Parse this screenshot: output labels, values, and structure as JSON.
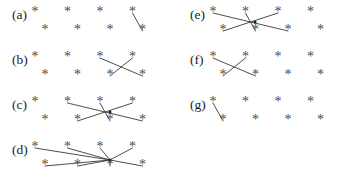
{
  "figure": {
    "title": "",
    "point_glyph": "*",
    "line_color": "#3a3a3a",
    "point_color": "#4a4a4a",
    "label_color": "#1a1a1a",
    "background_color": "#ffffff",
    "grid": {
      "columns": 4,
      "rows": 2,
      "column_spacing": 32.5,
      "row_spacing": 18,
      "bottom_row_offset": 10
    },
    "panels": [
      {
        "id": "a",
        "label": "(a)",
        "label_x": 12,
        "label_y": 19,
        "origin_x": 35,
        "origin_y": 13,
        "point_count": 8,
        "line_count": 1,
        "line_description": "one vertical segment at column 4",
        "lines": [
          {
            "name": "vertical-col4",
            "x1": 132.5,
            "y1": 13,
            "x2": 142.5,
            "y2": 31
          }
        ]
      },
      {
        "id": "b",
        "label": "(b)",
        "label_x": 12,
        "label_y": 64,
        "origin_x": 35,
        "origin_y": 58,
        "point_count": 8,
        "line_count": 2,
        "line_description": "one X crossing between columns 3 and 4",
        "lines": [
          {
            "name": "diag-down-c3-c4",
            "x1": 100,
            "y1": 58,
            "x2": 142.5,
            "y2": 76
          },
          {
            "name": "diag-up-c4-c3",
            "x1": 132.5,
            "y1": 58,
            "x2": 110,
            "y2": 76
          }
        ]
      },
      {
        "id": "c",
        "label": "(c)",
        "label_x": 12,
        "label_y": 109,
        "origin_x": 35,
        "origin_y": 103,
        "point_count": 8,
        "line_count": 3,
        "line_description": "three lines crossing at a common point over columns 2 to 4",
        "hub": {
          "x": 110,
          "y": 112
        },
        "lines": [
          {
            "name": "diag-c2-to-c4",
            "x1": 67.5,
            "y1": 103,
            "x2": 142.5,
            "y2": 121
          },
          {
            "name": "diag-c4-to-c2",
            "x1": 132.5,
            "y1": 103,
            "x2": 77.5,
            "y2": 121
          },
          {
            "name": "vertical-c3",
            "x1": 100,
            "y1": 103,
            "x2": 110,
            "y2": 121
          }
        ]
      },
      {
        "id": "d",
        "label": "(d)",
        "label_x": 12,
        "label_y": 154,
        "origin_x": 35,
        "origin_y": 148,
        "point_count": 8,
        "line_count": 4,
        "line_description": "four lines converging at a single hub node; every point connected",
        "hub": {
          "x": 110,
          "y": 160
        },
        "lines": [
          {
            "name": "ray-c1-top",
            "x1": 35,
            "y1": 148,
            "x2": 110,
            "y2": 160
          },
          {
            "name": "ray-c2-top",
            "x1": 67.5,
            "y1": 148,
            "x2": 110,
            "y2": 160
          },
          {
            "name": "ray-c3-top",
            "x1": 100,
            "y1": 148,
            "x2": 110,
            "y2": 160
          },
          {
            "name": "ray-c4-top",
            "x1": 132.5,
            "y1": 148,
            "x2": 110,
            "y2": 160
          },
          {
            "name": "ray-c1-bottom",
            "x1": 45,
            "y1": 166,
            "x2": 110,
            "y2": 160
          },
          {
            "name": "ray-c2-bottom",
            "x1": 77.5,
            "y1": 166,
            "x2": 110,
            "y2": 160
          },
          {
            "name": "ray-c3-bottom",
            "x1": 110,
            "y1": 166,
            "x2": 110,
            "y2": 160
          },
          {
            "name": "ray-c4-bottom",
            "x1": 142.5,
            "y1": 166,
            "x2": 110,
            "y2": 160
          }
        ]
      },
      {
        "id": "e",
        "label": "(e)",
        "label_x": 190,
        "label_y": 19,
        "origin_x": 213,
        "origin_y": 13,
        "point_count": 8,
        "line_count": 3,
        "line_description": "three lines crossing at a common point over columns 1 to 3",
        "hub": {
          "x": 255,
          "y": 22
        },
        "lines": [
          {
            "name": "diag-c1-to-c3",
            "x1": 213,
            "y1": 13,
            "x2": 288,
            "y2": 31
          },
          {
            "name": "diag-c3-to-c1",
            "x1": 278,
            "y1": 13,
            "x2": 223,
            "y2": 31
          },
          {
            "name": "vertical-c2",
            "x1": 245.5,
            "y1": 13,
            "x2": 255.5,
            "y2": 31
          }
        ]
      },
      {
        "id": "f",
        "label": "(f)",
        "label_x": 190,
        "label_y": 64,
        "origin_x": 213,
        "origin_y": 58,
        "point_count": 8,
        "line_count": 2,
        "line_description": "one X crossing between columns 1 and 2",
        "lines": [
          {
            "name": "diag-down-c1-c2",
            "x1": 213,
            "y1": 58,
            "x2": 255.5,
            "y2": 76
          },
          {
            "name": "diag-up-c2-c1",
            "x1": 245.5,
            "y1": 58,
            "x2": 223,
            "y2": 76
          }
        ]
      },
      {
        "id": "g",
        "label": "(g)",
        "label_x": 190,
        "label_y": 109,
        "origin_x": 213,
        "origin_y": 103,
        "point_count": 8,
        "line_count": 1,
        "line_description": "one vertical segment at column 1",
        "lines": [
          {
            "name": "vertical-col1",
            "x1": 213,
            "y1": 103,
            "x2": 223,
            "y2": 121
          }
        ]
      }
    ]
  }
}
